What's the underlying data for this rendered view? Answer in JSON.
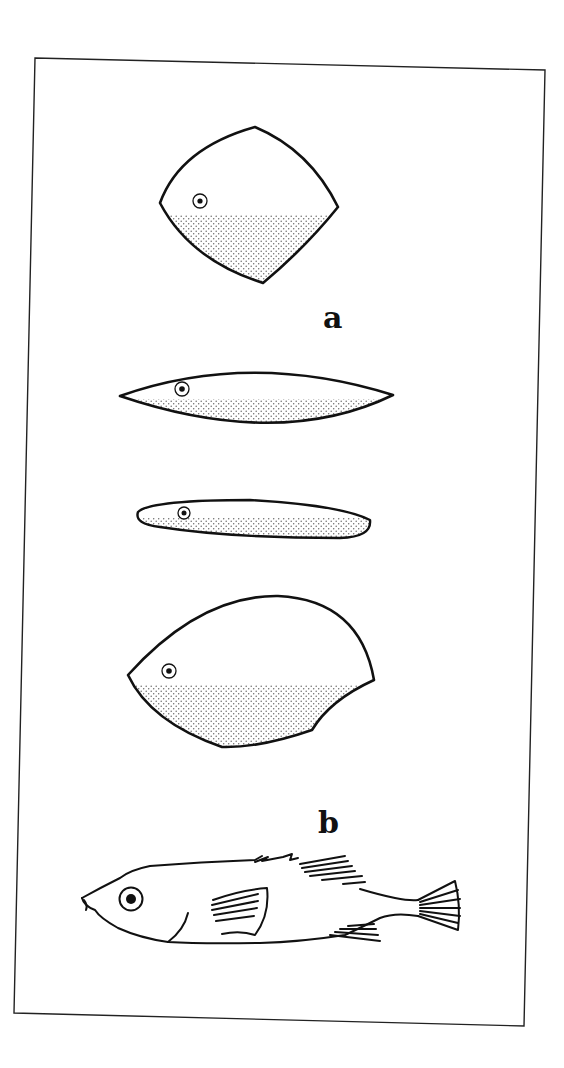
{
  "figure": {
    "labels": {
      "a": "a",
      "b": "b"
    },
    "panels": [
      {
        "label": "a",
        "items": [
          "deep-bodied fish outline (diamond)",
          "fusiform fish outline (lens)",
          "slender fish outline (elongate)",
          "deep-bodied fish outline (ovoid)"
        ]
      },
      {
        "label": "b",
        "items": [
          "stickleback drawing"
        ]
      }
    ],
    "colors": {
      "ink": "#111111",
      "stipple": "#6a6a6a",
      "paper": "#ffffff"
    }
  }
}
